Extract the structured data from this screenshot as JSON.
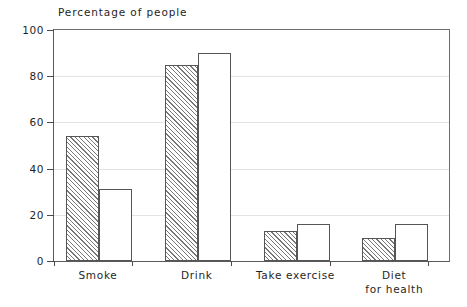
{
  "chart_data": {
    "type": "bar",
    "title": "Percentage of people",
    "xlabel": "",
    "ylabel": "",
    "ylim": [
      0,
      100
    ],
    "yticks": [
      0,
      20,
      40,
      60,
      80,
      100
    ],
    "grid": true,
    "legend": "none",
    "categories": [
      "Smoke",
      "Drink",
      "Take exercise",
      "Diet\nfor health"
    ],
    "category_labels": [
      {
        "line1": "Smoke",
        "line2": ""
      },
      {
        "line1": "Drink",
        "line2": ""
      },
      {
        "line1": "Take exercise",
        "line2": ""
      },
      {
        "line1": "Diet",
        "line2": "for health"
      }
    ],
    "series": [
      {
        "name": "series-hatched",
        "fill": "diagonal-hatch",
        "values": [
          54,
          85,
          13,
          10
        ]
      },
      {
        "name": "series-plain",
        "fill": "white",
        "values": [
          31,
          90,
          16,
          16
        ]
      }
    ],
    "colors": {
      "axis": "#4a4a4a",
      "frame": "#6e6e6e",
      "grid": "#e3e3e3",
      "bar_outline": "#555555",
      "hatch": "#777777",
      "background": "#ffffff",
      "text": "#1f1f1f"
    }
  },
  "axis": {
    "tick_labels": [
      "0",
      "20",
      "40",
      "60",
      "80",
      "100"
    ]
  }
}
